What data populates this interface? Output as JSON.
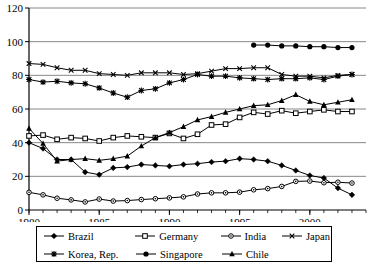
{
  "chart_data": {
    "type": "line",
    "title": "",
    "xlabel": "",
    "ylabel": "",
    "xlim": [
      1980,
      2004
    ],
    "ylim": [
      0,
      120
    ],
    "ytick_values": [
      0,
      20,
      40,
      60,
      80,
      100,
      120
    ],
    "ytick_labels": [
      "0",
      "20",
      "40",
      "60",
      "80",
      "100",
      "120"
    ],
    "xtick_values": [
      1980,
      1985,
      1990,
      1995,
      2000
    ],
    "xtick_labels": [
      "1980",
      "1985",
      "1990",
      "1995",
      "2000"
    ],
    "grid": "horizontal",
    "legend_position": "bottom",
    "x": [
      1980,
      1981,
      1982,
      1983,
      1984,
      1985,
      1986,
      1987,
      1988,
      1989,
      1990,
      1991,
      1992,
      1993,
      1994,
      1995,
      1996,
      1997,
      1998,
      1999,
      2000,
      2001,
      2002,
      2003
    ],
    "series": [
      {
        "name": "Brazil",
        "marker": "filled-diamond",
        "color": "#000000",
        "x": [
          1980,
          1981,
          1982,
          1983,
          1984,
          1985,
          1986,
          1987,
          1988,
          1989,
          1990,
          1991,
          1992,
          1993,
          1994,
          1995,
          1996,
          1997,
          1998,
          1999,
          2000,
          2001,
          2002,
          2003
        ],
        "values": [
          40.0,
          36.5,
          30.0,
          30.0,
          22.5,
          21.0,
          25.0,
          25.5,
          27.0,
          26.5,
          26.0,
          27.0,
          27.5,
          28.5,
          29.0,
          30.5,
          30.0,
          29.0,
          26.5,
          23.5,
          20.5,
          19.0,
          13.0,
          9.0
        ]
      },
      {
        "name": "Germany",
        "marker": "open-square",
        "color": "#000000",
        "x": [
          1980,
          1981,
          1982,
          1983,
          1984,
          1985,
          1986,
          1987,
          1988,
          1989,
          1990,
          1991,
          1992,
          1993,
          1994,
          1995,
          1996,
          1997,
          1998,
          1999,
          2000,
          2001,
          2002,
          2003
        ],
        "values": [
          44.0,
          44.5,
          42.0,
          43.0,
          42.5,
          41.0,
          43.0,
          44.0,
          43.5,
          43.0,
          45.5,
          42.5,
          45.0,
          50.5,
          51.0,
          55.0,
          58.0,
          57.0,
          59.0,
          57.5,
          58.5,
          59.5,
          58.5,
          58.5
        ]
      },
      {
        "name": "India",
        "marker": "dot-circle",
        "color": "#000000",
        "x": [
          1980,
          1981,
          1982,
          1983,
          1984,
          1985,
          1986,
          1987,
          1988,
          1989,
          1990,
          1991,
          1992,
          1993,
          1994,
          1995,
          1996,
          1997,
          1998,
          1999,
          2000,
          2001,
          2002,
          2003
        ],
        "values": [
          10.5,
          9.0,
          7.0,
          6.0,
          4.8,
          6.5,
          5.3,
          5.6,
          6.2,
          6.7,
          7.2,
          7.8,
          9.5,
          10.2,
          10.2,
          10.6,
          12.0,
          12.7,
          14.0,
          17.0,
          17.2,
          16.2,
          16.5,
          16.0
        ]
      },
      {
        "name": "Japan",
        "marker": "x-cross",
        "color": "#000000",
        "x": [
          1980,
          1981,
          1982,
          1983,
          1984,
          1985,
          1986,
          1987,
          1988,
          1989,
          1990,
          1991,
          1992,
          1993,
          1994,
          1995,
          1996,
          1997,
          1998,
          1999,
          2000,
          2001,
          2002,
          2003
        ],
        "values": [
          87.0,
          86.5,
          84.5,
          83.0,
          83.0,
          81.0,
          80.5,
          80.0,
          81.5,
          81.5,
          81.5,
          80.5,
          81.0,
          82.5,
          84.0,
          84.0,
          84.5,
          84.5,
          80.5,
          79.5,
          79.5,
          78.5,
          80.0,
          80.5
        ]
      },
      {
        "name": "Korea, Rep.",
        "marker": "star-asterisk",
        "color": "#000000",
        "x": [
          1980,
          1981,
          1982,
          1983,
          1984,
          1985,
          1986,
          1987,
          1988,
          1989,
          1990,
          1991,
          1992,
          1993,
          1994,
          1995,
          1996,
          1997,
          1998,
          1999,
          2000,
          2001,
          2002,
          2003
        ],
        "values": [
          77.5,
          76.0,
          76.5,
          75.5,
          75.0,
          72.5,
          69.5,
          67.0,
          71.0,
          72.0,
          75.5,
          77.5,
          80.5,
          79.5,
          79.5,
          78.5,
          78.0,
          77.5,
          78.0,
          78.0,
          78.5,
          77.5,
          79.5,
          80.5
        ]
      },
      {
        "name": "Singapore",
        "marker": "filled-circle",
        "color": "#000000",
        "x": [
          1996,
          1997,
          1998,
          1999,
          2000,
          2001,
          2002,
          2003
        ],
        "values": [
          98.0,
          98.0,
          97.5,
          97.5,
          97.0,
          97.0,
          96.5,
          96.5
        ]
      },
      {
        "name": "Chile",
        "marker": "filled-triangle",
        "color": "#000000",
        "x": [
          1980,
          1981,
          1982,
          1983,
          1984,
          1985,
          1986,
          1987,
          1988,
          1989,
          1990,
          1991,
          1992,
          1993,
          1994,
          1995,
          1996,
          1997,
          1998,
          1999,
          2000,
          2001,
          2002,
          2003
        ],
        "values": [
          48.5,
          39.5,
          29.0,
          30.0,
          30.5,
          29.5,
          30.5,
          32.0,
          38.0,
          43.0,
          46.0,
          49.5,
          53.5,
          55.5,
          58.0,
          60.0,
          62.0,
          62.5,
          65.0,
          68.5,
          64.5,
          62.5,
          64.0,
          65.5
        ]
      }
    ]
  },
  "legend": {
    "items": [
      {
        "label": "Brazil",
        "marker": "filled-diamond"
      },
      {
        "label": "Germany",
        "marker": "open-square"
      },
      {
        "label": "India",
        "marker": "dot-circle"
      },
      {
        "label": "Japan",
        "marker": "x-cross"
      },
      {
        "label": "Korea, Rep.",
        "marker": "star-asterisk"
      },
      {
        "label": "Singapore",
        "marker": "filled-circle"
      },
      {
        "label": "Chile",
        "marker": "filled-triangle"
      }
    ]
  },
  "style": {
    "line_color": "#000000",
    "grid_color": "#888888",
    "axis_color": "#000000",
    "background": "#ffffff"
  }
}
